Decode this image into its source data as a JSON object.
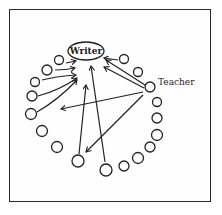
{
  "diagram": {
    "writer_label": "Writer",
    "teacher_label": "Teacher",
    "colors": {
      "ink": "#222222",
      "background": "#ffffff",
      "frame": "#2a2a2a"
    },
    "nodes": {
      "writer": {
        "cx": 86,
        "cy": 51,
        "rx": 18,
        "ry": 9
      },
      "teacher": {
        "cx": 150,
        "cy": 87,
        "r": 5
      },
      "students": [
        {
          "cx": 59,
          "cy": 60,
          "r": 4.5
        },
        {
          "cx": 47,
          "cy": 70,
          "r": 5
        },
        {
          "cx": 35,
          "cy": 82,
          "r": 4.5
        },
        {
          "cx": 32,
          "cy": 96,
          "r": 5
        },
        {
          "cx": 31,
          "cy": 114,
          "r": 5.5
        },
        {
          "cx": 42,
          "cy": 131,
          "r": 5.5
        },
        {
          "cx": 57,
          "cy": 147,
          "r": 5.5
        },
        {
          "cx": 78,
          "cy": 161,
          "r": 6
        },
        {
          "cx": 106,
          "cy": 170,
          "r": 6
        },
        {
          "cx": 124,
          "cy": 166,
          "r": 5
        },
        {
          "cx": 138,
          "cy": 158,
          "r": 5.5
        },
        {
          "cx": 150,
          "cy": 147,
          "r": 5
        },
        {
          "cx": 157,
          "cy": 135,
          "r": 5.5
        },
        {
          "cx": 157,
          "cy": 118,
          "r": 5
        },
        {
          "cx": 157,
          "cy": 102,
          "r": 4.5
        },
        {
          "cx": 138,
          "cy": 72,
          "r": 4.5
        },
        {
          "cx": 124,
          "cy": 59,
          "r": 4.5
        }
      ]
    },
    "arrows": [
      {
        "from": "student-0",
        "to": "writer",
        "d": "M66,63 L76,61"
      },
      {
        "from": "student-1",
        "to": "writer",
        "d": "M55,70 Q66,70 75,68"
      },
      {
        "from": "student-2",
        "to": "writer",
        "d": "M42,80 Q58,76 76,75"
      },
      {
        "from": "student-3",
        "to": "writer",
        "d": "M38,96 Q60,90 77,78"
      },
      {
        "from": "student-4",
        "to": "writer",
        "d": "M37,112 Q58,100 77,80"
      },
      {
        "from": "student-7",
        "to": "writer",
        "d": "M79,154 L86,85"
      },
      {
        "from": "student-8",
        "to": "writer",
        "d": "M105,162 L91,66"
      },
      {
        "from": "student-16",
        "to": "writer",
        "d": "M118,60 L104,58"
      },
      {
        "from": "teacher",
        "to": "writer",
        "d": "M145,85 L106,60"
      },
      {
        "from": "teacher",
        "to": "writer",
        "d": "M144,88 L104,67"
      },
      {
        "from": "teacher",
        "to": "student-left",
        "d": "M143,92 L61,109"
      },
      {
        "from": "teacher",
        "to": "student-bottom",
        "d": "M143,95 L86,152"
      }
    ]
  }
}
